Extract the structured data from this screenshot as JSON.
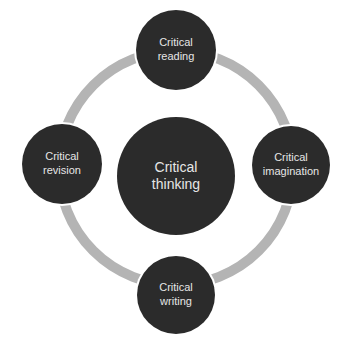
{
  "diagram": {
    "type": "cycle",
    "colors": {
      "node": "#2b2b2b",
      "ring": "#b4b4b4",
      "text": "#e6e6e6"
    },
    "center": {
      "line1": "Critical",
      "line2": "thinking"
    },
    "nodes": [
      {
        "position": "top",
        "line1": "Critical",
        "line2": "reading"
      },
      {
        "position": "right",
        "line1": "Critical",
        "line2": "imagination"
      },
      {
        "position": "bottom",
        "line1": "Critical",
        "line2": "writing"
      },
      {
        "position": "left",
        "line1": "Critical",
        "line2": "revision"
      }
    ]
  }
}
